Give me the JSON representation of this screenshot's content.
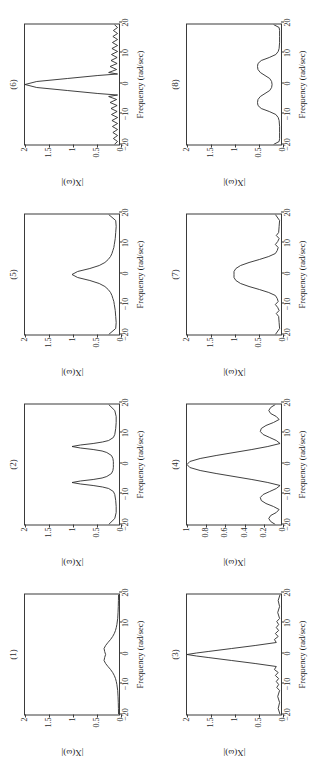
{
  "figure": {
    "orientation": "rotated-90-ccw",
    "rows": 2,
    "cols": 4,
    "axis": {
      "xlabel": "Frequency (rad/sec)",
      "ylabel": "|X(ω)|",
      "xticks": [
        "−20",
        "−10",
        "0",
        "10",
        "20"
      ],
      "xtickvalues": [
        -20,
        -10,
        0,
        10,
        20
      ],
      "xlim": [
        -20,
        20
      ]
    }
  },
  "chart_data": [
    {
      "id": "plot-1",
      "type": "line",
      "title": "(1)",
      "xlabel": "Frequency (rad/sec)",
      "ylabel": "|X(ω)|",
      "xlim": [
        -20,
        20
      ],
      "ylim": [
        0,
        2
      ],
      "yticks": [
        0,
        0.5,
        1,
        1.5,
        2
      ],
      "yticklabels": [
        "0",
        "0.5",
        "1",
        "1.5",
        "2"
      ],
      "grid": false,
      "legend": "none",
      "description": "Low broad double-hump centred on 0, peak magnitude about 0.32 near ω=±2, small dip at ω=0, decaying to ~0 beyond ±10.",
      "peaks": [
        {
          "x": -2.2,
          "y": 0.32
        },
        {
          "x": 0,
          "y": 0.28
        },
        {
          "x": 2.2,
          "y": 0.32
        }
      ],
      "x": [
        -20,
        -18,
        -16,
        -14,
        -12,
        -10,
        -9,
        -8,
        -7,
        -6,
        -5,
        -4,
        -3,
        -2,
        -1,
        0,
        1,
        2,
        3,
        4,
        5,
        6,
        7,
        8,
        9,
        10,
        12,
        14,
        16,
        18,
        20
      ],
      "values": [
        0.01,
        0.012,
        0.015,
        0.02,
        0.028,
        0.045,
        0.058,
        0.075,
        0.1,
        0.135,
        0.18,
        0.235,
        0.285,
        0.318,
        0.305,
        0.285,
        0.305,
        0.318,
        0.285,
        0.235,
        0.18,
        0.135,
        0.1,
        0.075,
        0.058,
        0.045,
        0.028,
        0.02,
        0.015,
        0.012,
        0.01
      ]
    },
    {
      "id": "plot-2",
      "type": "line",
      "title": "(2)",
      "xlabel": "Frequency (rad/sec)",
      "ylabel": "|X(ω)|",
      "xlim": [
        -20,
        20
      ],
      "ylim": [
        0,
        2
      ],
      "yticks": [
        0,
        0.5,
        1,
        1.5,
        2
      ],
      "yticklabels": [
        "0",
        "0.5",
        "1",
        "1.5",
        "2"
      ],
      "grid": false,
      "legend": "none",
      "description": "Two sharp Lorentzian peaks of height 1.0 at ω = ±6 rad/sec, baseline near 0.1 between them, small rise at the ±20 edges.",
      "peaks": [
        {
          "x": -6,
          "y": 1.0
        },
        {
          "x": 6,
          "y": 1.0
        }
      ],
      "x": [
        -20,
        -18,
        -16,
        -14,
        -12,
        -10,
        -9,
        -8,
        -7.5,
        -7,
        -6.5,
        -6,
        -5.5,
        -5,
        -4.5,
        -4,
        -3,
        -2,
        -1,
        0,
        1,
        2,
        3,
        4,
        4.5,
        5,
        5.5,
        6,
        6.5,
        7,
        7.5,
        8,
        9,
        10,
        12,
        14,
        16,
        18,
        20
      ],
      "values": [
        0.22,
        0.09,
        0.06,
        0.06,
        0.07,
        0.09,
        0.12,
        0.22,
        0.35,
        0.55,
        0.82,
        1.0,
        0.82,
        0.55,
        0.36,
        0.26,
        0.16,
        0.13,
        0.12,
        0.12,
        0.12,
        0.13,
        0.16,
        0.26,
        0.36,
        0.55,
        0.82,
        1.0,
        0.82,
        0.55,
        0.35,
        0.22,
        0.12,
        0.09,
        0.07,
        0.06,
        0.06,
        0.09,
        0.22
      ]
    },
    {
      "id": "plot-3",
      "type": "line",
      "title": "(3)",
      "xlabel": "Frequency (rad/sec)",
      "ylabel": "|X(ω)|",
      "xlim": [
        -20,
        20
      ],
      "ylim": [
        0,
        2
      ],
      "yticks": [
        0,
        0.5,
        1,
        1.5,
        2
      ],
      "yticklabels": [
        "0",
        "0.5",
        "1",
        "1.5",
        "2"
      ],
      "grid": false,
      "legend": "none",
      "description": "Very narrow sharp triangular main lobe reaching 2.0 at ω=0, falling almost linearly to ~0 by ω=±4, with small ripples out to ±20.",
      "peaks": [
        {
          "x": 0,
          "y": 2.0
        }
      ],
      "x": [
        -20,
        -18,
        -16,
        -14,
        -12,
        -11,
        -10,
        -9,
        -8,
        -7,
        -6,
        -5,
        -4,
        -3,
        -2,
        -1,
        -0.5,
        0,
        0.5,
        1,
        2,
        3,
        4,
        5,
        6,
        7,
        8,
        9,
        10,
        11,
        12,
        14,
        16,
        18,
        20
      ],
      "values": [
        0.02,
        0.06,
        0.03,
        0.07,
        0.03,
        0.09,
        0.05,
        0.1,
        0.05,
        0.12,
        0.06,
        0.14,
        0.1,
        0.55,
        1.05,
        1.55,
        1.8,
        2.0,
        1.8,
        1.55,
        1.05,
        0.55,
        0.1,
        0.14,
        0.06,
        0.12,
        0.05,
        0.1,
        0.05,
        0.09,
        0.03,
        0.07,
        0.03,
        0.06,
        0.02
      ]
    },
    {
      "id": "plot-4",
      "type": "line",
      "title": "(4)",
      "xlabel": "Frequency (rad/sec)",
      "ylabel": "|X(ω)|",
      "xlim": [
        -20,
        20
      ],
      "ylim": [
        0,
        1
      ],
      "yticks": [
        0,
        0.2,
        0.4,
        0.6,
        0.8,
        1
      ],
      "yticklabels": [
        "0",
        "0.2",
        "0.4",
        "0.6",
        "0.8",
        "1"
      ],
      "grid": false,
      "legend": "none",
      "description": "Rectified sinc: main lobe of height 1.0 at ω=0 with nulls at ±7, side lobes of ~0.22 at ±11 and ~0.13 at ±18.",
      "peaks": [
        {
          "x": 0,
          "y": 1.0
        },
        {
          "x": -11,
          "y": 0.22
        },
        {
          "x": 11,
          "y": 0.22
        },
        {
          "x": -18,
          "y": 0.13
        },
        {
          "x": 18,
          "y": 0.13
        }
      ],
      "x": [
        -20,
        -19,
        -18,
        -17,
        -16,
        -15,
        -14,
        -13,
        -12,
        -11,
        -10,
        -9,
        -8,
        -7,
        -6,
        -5,
        -4,
        -3,
        -2,
        -1,
        0,
        1,
        2,
        3,
        4,
        5,
        6,
        7,
        8,
        9,
        10,
        11,
        12,
        13,
        14,
        15,
        16,
        17,
        18,
        19,
        20
      ],
      "values": [
        0.06,
        0.11,
        0.13,
        0.11,
        0.05,
        0.02,
        0.08,
        0.16,
        0.21,
        0.22,
        0.19,
        0.12,
        0.05,
        0.01,
        0.14,
        0.31,
        0.5,
        0.69,
        0.86,
        0.97,
        1.0,
        0.97,
        0.86,
        0.69,
        0.5,
        0.31,
        0.14,
        0.01,
        0.05,
        0.12,
        0.19,
        0.22,
        0.21,
        0.16,
        0.08,
        0.02,
        0.05,
        0.11,
        0.13,
        0.11,
        0.06
      ]
    },
    {
      "id": "plot-5",
      "type": "line",
      "title": "(5)",
      "xlabel": "Frequency (rad/sec)",
      "ylabel": "|X(ω)|",
      "xlim": [
        -20,
        20
      ],
      "ylim": [
        0,
        2
      ],
      "yticks": [
        0,
        0.5,
        1,
        1.5,
        2
      ],
      "yticklabels": [
        "0",
        "0.5",
        "1",
        "1.5",
        "2"
      ],
      "grid": false,
      "legend": "none",
      "description": "Single Lorentzian peak of height 1.0 at ω=0 decaying smoothly toward 0.06 by ω=±15; small upturn at the ±20 edges.",
      "peaks": [
        {
          "x": 0,
          "y": 1.0
        }
      ],
      "x": [
        -20,
        -18,
        -16,
        -14,
        -12,
        -10,
        -9,
        -8,
        -7,
        -6,
        -5,
        -4,
        -3,
        -2,
        -1,
        0,
        1,
        2,
        3,
        4,
        5,
        6,
        7,
        8,
        9,
        10,
        12,
        14,
        16,
        18,
        20
      ],
      "values": [
        0.22,
        0.07,
        0.06,
        0.07,
        0.08,
        0.1,
        0.11,
        0.13,
        0.15,
        0.18,
        0.23,
        0.3,
        0.42,
        0.62,
        0.88,
        1.0,
        0.88,
        0.62,
        0.42,
        0.3,
        0.23,
        0.18,
        0.15,
        0.13,
        0.11,
        0.1,
        0.08,
        0.07,
        0.06,
        0.07,
        0.22
      ]
    },
    {
      "id": "plot-6",
      "type": "line",
      "title": "(6)",
      "xlabel": "Frequency (rad/sec)",
      "ylabel": "|X(ω)|",
      "xlim": [
        -20,
        20
      ],
      "ylim": [
        0,
        2
      ],
      "yticks": [
        0,
        0.5,
        1,
        1.5,
        2
      ],
      "yticklabels": [
        "0",
        "0.5",
        "1",
        "1.5",
        "2"
      ],
      "grid": false,
      "legend": "none",
      "description": "Rectified sinc with tall narrow main lobe of height 2.0 at ω=0, nulls near ±3.5, and a train of decaying ripples (0.2 down to 0.1) out to ±20.",
      "peaks": [
        {
          "x": 0,
          "y": 2.0
        }
      ],
      "x": [
        -20,
        -19,
        -18,
        -17,
        -16,
        -15,
        -14,
        -13,
        -12,
        -11,
        -10,
        -9,
        -8,
        -7,
        -6,
        -5,
        -4,
        -3.5,
        -3,
        -2,
        -1,
        0,
        1,
        2,
        3,
        3.5,
        4,
        5,
        6,
        7,
        8,
        9,
        10,
        11,
        12,
        13,
        14,
        15,
        16,
        17,
        18,
        19,
        20
      ],
      "values": [
        0.1,
        0.03,
        0.12,
        0.03,
        0.13,
        0.03,
        0.14,
        0.03,
        0.15,
        0.03,
        0.16,
        0.04,
        0.17,
        0.04,
        0.19,
        0.05,
        0.22,
        0.03,
        0.45,
        1.1,
        1.75,
        2.0,
        1.75,
        1.1,
        0.45,
        0.03,
        0.22,
        0.05,
        0.19,
        0.04,
        0.17,
        0.04,
        0.16,
        0.03,
        0.15,
        0.03,
        0.14,
        0.03,
        0.13,
        0.03,
        0.12,
        0.03,
        0.1
      ]
    },
    {
      "id": "plot-7",
      "type": "line",
      "title": "(7)",
      "xlabel": "Frequency (rad/sec)",
      "ylabel": "|X(ω)|",
      "xlim": [
        -20,
        20
      ],
      "ylim": [
        0,
        2
      ],
      "yticks": [
        0,
        0.5,
        1,
        1.5,
        2
      ],
      "yticklabels": [
        "0",
        "0.5",
        "1",
        "1.5",
        "2"
      ],
      "grid": false,
      "legend": "none",
      "description": "Broad bell-shaped main lobe of height 1.0 at ω=0, reaching baseline near ±7, with small ripples ~0.1 beyond.",
      "peaks": [
        {
          "x": 0,
          "y": 1.0
        }
      ],
      "x": [
        -20,
        -18,
        -16,
        -14,
        -13,
        -12,
        -11,
        -10,
        -9,
        -8,
        -7,
        -6,
        -5,
        -4,
        -3,
        -2,
        -1,
        0,
        1,
        2,
        3,
        4,
        5,
        6,
        7,
        8,
        9,
        10,
        11,
        12,
        13,
        14,
        16,
        18,
        20
      ],
      "values": [
        0.12,
        0.03,
        0.04,
        0.05,
        0.1,
        0.04,
        0.07,
        0.12,
        0.06,
        0.08,
        0.12,
        0.26,
        0.46,
        0.68,
        0.86,
        0.96,
        1.0,
        1.0,
        1.0,
        0.96,
        0.86,
        0.68,
        0.46,
        0.26,
        0.12,
        0.08,
        0.06,
        0.12,
        0.07,
        0.04,
        0.1,
        0.05,
        0.04,
        0.03,
        0.12
      ]
    },
    {
      "id": "plot-8",
      "type": "line",
      "title": "(8)",
      "xlabel": "Frequency (rad/sec)",
      "ylabel": "|X(ω)|",
      "xlim": [
        -20,
        20
      ],
      "ylim": [
        0,
        2
      ],
      "yticks": [
        0,
        0.5,
        1,
        1.5,
        2
      ],
      "yticklabels": [
        "0",
        "0.5",
        "1",
        "1.5",
        "2"
      ],
      "grid": false,
      "legend": "none",
      "description": "Two rounded lobes of height about 0.5 centred at ω = ±6 rad/sec, dipping to ~0.2 at ω=0 and to ~0.03 outside ±10; small spikes at the ±20 edges.",
      "peaks": [
        {
          "x": -6,
          "y": 0.5
        },
        {
          "x": 6,
          "y": 0.5
        }
      ],
      "x": [
        -20,
        -19,
        -18,
        -16,
        -14,
        -12,
        -11,
        -10,
        -9,
        -8,
        -7,
        -6,
        -5,
        -4,
        -3,
        -2,
        -1,
        0,
        1,
        2,
        3,
        4,
        5,
        6,
        7,
        8,
        9,
        10,
        11,
        12,
        14,
        16,
        18,
        19,
        20
      ],
      "values": [
        0.16,
        0.04,
        0.03,
        0.03,
        0.03,
        0.04,
        0.06,
        0.11,
        0.25,
        0.42,
        0.49,
        0.5,
        0.49,
        0.44,
        0.34,
        0.24,
        0.2,
        0.19,
        0.2,
        0.24,
        0.34,
        0.44,
        0.49,
        0.5,
        0.49,
        0.42,
        0.25,
        0.11,
        0.06,
        0.04,
        0.03,
        0.03,
        0.03,
        0.04,
        0.16
      ]
    }
  ]
}
